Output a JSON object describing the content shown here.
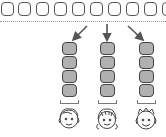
{
  "diagram": {
    "top_row": {
      "box_count": 10,
      "box_style": "white rounded square",
      "spacing_px": 18
    },
    "separator": "dotted-line",
    "arrows": [
      {
        "direction": "down-left"
      },
      {
        "direction": "down"
      },
      {
        "direction": "down-right"
      }
    ],
    "groups": [
      {
        "boxes": 4,
        "child": "boy-with-side-part",
        "x": 62
      },
      {
        "boxes": 4,
        "child": "girl-with-pigtails",
        "x": 100
      },
      {
        "boxes": 4,
        "child": "boy-with-spiky-hair",
        "x": 139
      }
    ],
    "colors": {
      "box_fill": "#b0b0b0",
      "outline": "#444444",
      "background": "#ffffff"
    }
  }
}
